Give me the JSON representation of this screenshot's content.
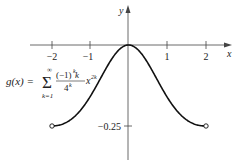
{
  "chart_data": {
    "type": "line",
    "title": "",
    "xlabel": "x",
    "ylabel": "y",
    "xlim": [
      -2.4,
      2.4
    ],
    "ylim": [
      -0.35,
      0.12
    ],
    "x_ticks": [
      "-2",
      "-1",
      "1",
      "2"
    ],
    "y_ticks": [
      "-0.25"
    ],
    "grid": false,
    "series": [
      {
        "name": "g(x)",
        "formula": "g(x) = Σ_{k=1}^{∞} (-1)^k k x^{2k} / 4^k",
        "x": [
          -2,
          -1.5,
          -1,
          -0.5,
          0,
          0.5,
          1,
          1.5,
          2
        ],
        "values": [
          -0.25,
          -0.2311,
          -0.16,
          -0.0554,
          0,
          -0.0554,
          -0.16,
          -0.2311,
          -0.25
        ],
        "endpoints": "open circles at (-2, -0.25) and (2, -0.25)"
      }
    ],
    "annotations": [
      "g(x) = Σ_{k=1}^{∞} ((-1)^k k / 4^k) x^{2k}"
    ]
  },
  "labels": {
    "x_axis": "x",
    "y_axis": "y",
    "tick_neg2": "−2",
    "tick_neg1": "−1",
    "tick_1": "1",
    "tick_2": "2",
    "tick_y": "−0.25",
    "formula_lhs": "g(x) =",
    "sum_symbol": "Σ",
    "sum_upper": "∞",
    "sum_lower": "k=1",
    "numerator": "(−1)",
    "num_exp": "k",
    "num_k": " k",
    "denominator": "4",
    "den_exp": "k",
    "x_term": "x",
    "x_exp": "2k"
  }
}
